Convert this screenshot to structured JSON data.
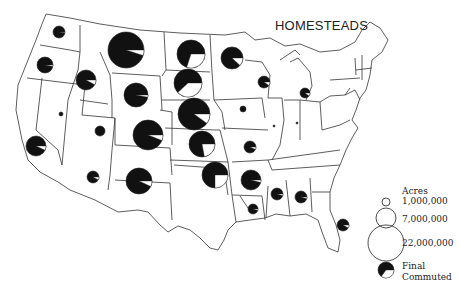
{
  "title": "HOMESTEADS",
  "legend": {
    "header": "Acres",
    "sizes": [
      {
        "label": "1,000,000",
        "r": 4
      },
      {
        "label": "7,000,000",
        "r": 10
      },
      {
        "label": "22,000,000",
        "r": 18
      }
    ],
    "final_label": "Final",
    "commuted_label": "Commuted"
  },
  "colors": {
    "final": "#111111",
    "commuted": "#ffffff",
    "border": "#222222"
  },
  "states": [
    {
      "name": "Washington",
      "cx": 59,
      "cy": 32,
      "r": 6,
      "commuted": 0.02
    },
    {
      "name": "Oregon",
      "cx": 45,
      "cy": 65,
      "r": 8,
      "commuted": 0.03
    },
    {
      "name": "Idaho",
      "cx": 86,
      "cy": 80,
      "r": 10,
      "commuted": 0.08
    },
    {
      "name": "Montana",
      "cx": 126,
      "cy": 50,
      "r": 18,
      "commuted": 0.05
    },
    {
      "name": "Wyoming",
      "cx": 136,
      "cy": 95,
      "r": 12,
      "commuted": 0.03
    },
    {
      "name": "Nevada",
      "cx": 61,
      "cy": 114,
      "r": 2,
      "commuted": 0
    },
    {
      "name": "Utah",
      "cx": 100,
      "cy": 131,
      "r": 5,
      "commuted": 0
    },
    {
      "name": "Colorado",
      "cx": 148,
      "cy": 135,
      "r": 15,
      "commuted": 0.06
    },
    {
      "name": "California",
      "cx": 36,
      "cy": 146,
      "r": 10,
      "commuted": 0.07
    },
    {
      "name": "Arizona",
      "cx": 93,
      "cy": 177,
      "r": 6,
      "commuted": 0.08
    },
    {
      "name": "New Mexico",
      "cx": 139,
      "cy": 181,
      "r": 13,
      "commuted": 0.07
    },
    {
      "name": "North Dakota",
      "cx": 191,
      "cy": 54,
      "r": 14,
      "commuted": 0.3
    },
    {
      "name": "South Dakota",
      "cx": 188,
      "cy": 83,
      "r": 14,
      "commuted": 0.38
    },
    {
      "name": "Nebraska",
      "cx": 194,
      "cy": 114,
      "r": 16,
      "commuted": 0.1
    },
    {
      "name": "Kansas",
      "cx": 202,
      "cy": 144,
      "r": 13,
      "commuted": 0.22
    },
    {
      "name": "Oklahoma",
      "cx": 215,
      "cy": 175,
      "r": 13,
      "commuted": 0.25
    },
    {
      "name": "Minnesota",
      "cx": 232,
      "cy": 58,
      "r": 11,
      "commuted": 0.12
    },
    {
      "name": "Wisconsin",
      "cx": 264,
      "cy": 82,
      "r": 6,
      "commuted": 0.1
    },
    {
      "name": "Michigan",
      "cx": 305,
      "cy": 93,
      "r": 5,
      "commuted": 0.1
    },
    {
      "name": "Iowa",
      "cx": 243,
      "cy": 109,
      "r": 3,
      "commuted": 0
    },
    {
      "name": "Missouri",
      "cx": 250,
      "cy": 147,
      "r": 6,
      "commuted": 0.07
    },
    {
      "name": "Illinois",
      "cx": 274,
      "cy": 126,
      "r": 1,
      "commuted": 0
    },
    {
      "name": "Indiana",
      "cx": 297,
      "cy": 123,
      "r": 1,
      "commuted": 0
    },
    {
      "name": "Arkansas",
      "cx": 251,
      "cy": 180,
      "r": 10,
      "commuted": 0.04
    },
    {
      "name": "Louisiana",
      "cx": 253,
      "cy": 209,
      "r": 5,
      "commuted": 0.05
    },
    {
      "name": "Mississippi",
      "cx": 277,
      "cy": 194,
      "r": 6,
      "commuted": 0.05
    },
    {
      "name": "Alabama",
      "cx": 301,
      "cy": 197,
      "r": 6,
      "commuted": 0.05
    },
    {
      "name": "Florida",
      "cx": 343,
      "cy": 225,
      "r": 6,
      "commuted": 0.08
    }
  ]
}
